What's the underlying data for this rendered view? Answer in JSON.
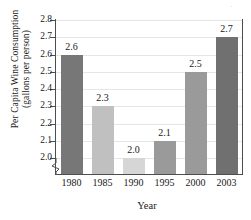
{
  "chart_data": {
    "type": "bar",
    "title": "",
    "categories": [
      "1980",
      "1985",
      "1990",
      "1995",
      "2000",
      "2003"
    ],
    "values": [
      2.6,
      2.3,
      2.0,
      2.1,
      2.5,
      2.7
    ],
    "point_labels": [
      "2.6",
      "2.3",
      "2.0",
      "2.1",
      "2.5",
      "2.7"
    ],
    "bar_colors": [
      "#777777",
      "#c0c0c0",
      "#d6d6d6",
      "#9a9a9a",
      "#9a9a9a",
      "#707070"
    ],
    "xlabel": "Year",
    "ylabel_line1": "Per Capita Wine Consumption",
    "ylabel_line2": "(gallons per person)",
    "ylim": [
      2.0,
      2.8
    ],
    "y_ticks": [
      "2.8",
      "2.7",
      "2.6",
      "2.5",
      "2.4",
      "2.3",
      "2.2",
      "2.1",
      "2.0"
    ],
    "y_tick_values": [
      2.8,
      2.7,
      2.6,
      2.5,
      2.4,
      2.3,
      2.2,
      2.1,
      2.0
    ],
    "grid": true,
    "grid_orientation": "horizontal",
    "legend": "none",
    "axis_break": true,
    "axis_break_note": "y-axis broken below 2.0",
    "baseline_value": 1.95,
    "artifact_mark": "·"
  }
}
